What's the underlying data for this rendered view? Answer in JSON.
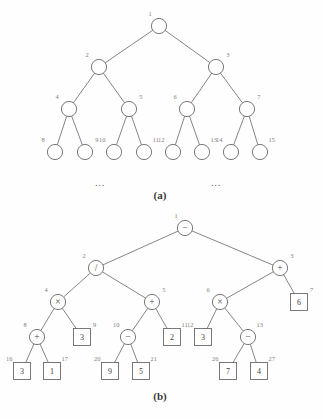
{
  "figure": {
    "panels": [
      {
        "id": "panel-a",
        "caption": "(a)",
        "ellipsis_left": "...",
        "ellipsis_right": "...",
        "nodes": [
          {
            "id": "1",
            "index": "1",
            "shape": "circle",
            "label": "",
            "cx": 159,
            "cy": 26,
            "parent": null
          },
          {
            "id": "2",
            "index": "2",
            "shape": "circle",
            "label": "",
            "cx": 99,
            "cy": 67,
            "parent": "1"
          },
          {
            "id": "3",
            "index": "3",
            "shape": "circle",
            "label": "",
            "cx": 216,
            "cy": 67,
            "parent": "1"
          },
          {
            "id": "4",
            "index": "4",
            "shape": "circle",
            "label": "",
            "cx": 69,
            "cy": 109,
            "parent": "2"
          },
          {
            "id": "5",
            "index": "5",
            "shape": "circle",
            "label": "",
            "cx": 129,
            "cy": 109,
            "parent": "2"
          },
          {
            "id": "6",
            "index": "6",
            "shape": "circle",
            "label": "",
            "cx": 187,
            "cy": 109,
            "parent": "3"
          },
          {
            "id": "7",
            "index": "7",
            "shape": "circle",
            "label": "",
            "cx": 247,
            "cy": 109,
            "parent": "3"
          },
          {
            "id": "8",
            "index": "8",
            "shape": "circle",
            "label": "",
            "cx": 55,
            "cy": 152,
            "parent": "4"
          },
          {
            "id": "9",
            "index": "9",
            "shape": "circle",
            "label": "",
            "cx": 85,
            "cy": 152,
            "parent": "4"
          },
          {
            "id": "10",
            "index": "10",
            "shape": "circle",
            "label": "",
            "cx": 114,
            "cy": 152,
            "parent": "5"
          },
          {
            "id": "11",
            "index": "11",
            "shape": "circle",
            "label": "",
            "cx": 144,
            "cy": 152,
            "parent": "5"
          },
          {
            "id": "12",
            "index": "12",
            "shape": "circle",
            "label": "",
            "cx": 173,
            "cy": 152,
            "parent": "6"
          },
          {
            "id": "13",
            "index": "13",
            "shape": "circle",
            "label": "",
            "cx": 202,
            "cy": 152,
            "parent": "6"
          },
          {
            "id": "14",
            "index": "14",
            "shape": "circle",
            "label": "",
            "cx": 231,
            "cy": 152,
            "parent": "7"
          },
          {
            "id": "15",
            "index": "15",
            "shape": "circle",
            "label": "",
            "cx": 260,
            "cy": 152,
            "parent": "7"
          }
        ],
        "ellipsis_positions": [
          {
            "x": 100,
            "y": 186
          },
          {
            "x": 216,
            "y": 186
          }
        ],
        "caption_position": {
          "x": 160,
          "y": 199
        }
      },
      {
        "id": "panel-b",
        "caption": "(b)",
        "nodes": [
          {
            "id": "1",
            "index": "1",
            "shape": "circle",
            "label": "−",
            "cx": 185,
            "cy": 228,
            "parent": null
          },
          {
            "id": "2",
            "index": "2",
            "shape": "circle",
            "label": "/",
            "cx": 96,
            "cy": 268,
            "parent": "1"
          },
          {
            "id": "3",
            "index": "3",
            "shape": "circle",
            "label": "+",
            "cx": 280,
            "cy": 268,
            "parent": "1"
          },
          {
            "id": "4",
            "index": "4",
            "shape": "circle",
            "label": "×",
            "cx": 58,
            "cy": 302,
            "parent": "2"
          },
          {
            "id": "5",
            "index": "5",
            "shape": "circle",
            "label": "+",
            "cx": 152,
            "cy": 302,
            "parent": "2"
          },
          {
            "id": "6",
            "index": "6",
            "shape": "circle",
            "label": "×",
            "cx": 220,
            "cy": 302,
            "parent": "3"
          },
          {
            "id": "7",
            "index": "7",
            "shape": "box",
            "label": "6",
            "cx": 299,
            "cy": 302,
            "parent": "3"
          },
          {
            "id": "8",
            "index": "8",
            "shape": "circle",
            "label": "+",
            "cx": 37,
            "cy": 337,
            "parent": "4"
          },
          {
            "id": "9",
            "index": "9",
            "shape": "box",
            "label": "3",
            "cx": 82,
            "cy": 337,
            "parent": "4"
          },
          {
            "id": "10",
            "index": "10",
            "shape": "circle",
            "label": "−",
            "cx": 128,
            "cy": 337,
            "parent": "5"
          },
          {
            "id": "11",
            "index": "11",
            "shape": "box",
            "label": "2",
            "cx": 172,
            "cy": 337,
            "parent": "5"
          },
          {
            "id": "12",
            "index": "12",
            "shape": "box",
            "label": "3",
            "cx": 203,
            "cy": 337,
            "parent": "6"
          },
          {
            "id": "13",
            "index": "13",
            "shape": "circle",
            "label": "−",
            "cx": 248,
            "cy": 337,
            "parent": "6"
          },
          {
            "id": "16",
            "index": "16",
            "shape": "box",
            "label": "3",
            "cx": 22,
            "cy": 371,
            "parent": "8"
          },
          {
            "id": "17",
            "index": "17",
            "shape": "box",
            "label": "1",
            "cx": 52,
            "cy": 371,
            "parent": "8"
          },
          {
            "id": "20",
            "index": "20",
            "shape": "box",
            "label": "9",
            "cx": 110,
            "cy": 371,
            "parent": "10"
          },
          {
            "id": "21",
            "index": "21",
            "shape": "box",
            "label": "5",
            "cx": 141,
            "cy": 371,
            "parent": "10"
          },
          {
            "id": "26",
            "index": "26",
            "shape": "box",
            "label": "7",
            "cx": 228,
            "cy": 371,
            "parent": "13"
          },
          {
            "id": "27",
            "index": "27",
            "shape": "box",
            "label": "4",
            "cx": 259,
            "cy": 371,
            "parent": "13"
          }
        ],
        "caption_position": {
          "x": 160,
          "y": 400
        }
      }
    ],
    "geometry": {
      "circle_radius": 7.6,
      "box_half": 8.5,
      "index_offset_x": 10,
      "index_offset_y": 11
    },
    "colors": {
      "stroke": "#6a6a6a",
      "edge": "#6f6f6f",
      "index_text": "#7d7d7d",
      "node_text": "#3d3d3d",
      "background": "#fefefe"
    }
  }
}
